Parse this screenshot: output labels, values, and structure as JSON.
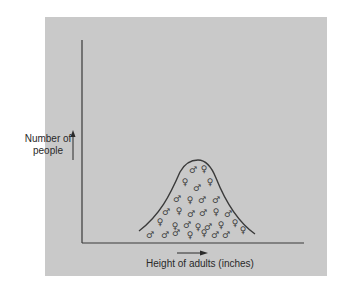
{
  "figure": {
    "y_axis_label_line1": "Number of",
    "y_axis_label_line2": "people",
    "x_axis_label": "Height of adults (inches)",
    "curve_type": "bell-shaped normal distribution",
    "symbols": {
      "male": "♂",
      "female": "♀"
    },
    "individuals": [
      {
        "sex": "male"
      },
      {
        "sex": "female"
      },
      {
        "sex": "female"
      },
      {
        "sex": "male"
      },
      {
        "sex": "female"
      },
      {
        "sex": "male"
      },
      {
        "sex": "female"
      },
      {
        "sex": "male"
      },
      {
        "sex": "male"
      },
      {
        "sex": "male"
      },
      {
        "sex": "female"
      },
      {
        "sex": "male"
      },
      {
        "sex": "male"
      },
      {
        "sex": "female"
      },
      {
        "sex": "male"
      },
      {
        "sex": "female"
      },
      {
        "sex": "female"
      },
      {
        "sex": "male"
      },
      {
        "sex": "female"
      },
      {
        "sex": "male"
      },
      {
        "sex": "female"
      },
      {
        "sex": "female"
      },
      {
        "sex": "male"
      },
      {
        "sex": "male"
      },
      {
        "sex": "male"
      },
      {
        "sex": "female"
      },
      {
        "sex": "female"
      },
      {
        "sex": "male"
      },
      {
        "sex": "male"
      },
      {
        "sex": "female"
      }
    ]
  },
  "colors": {
    "panel": "#c9c9c9",
    "ink": "#3a3a3a"
  }
}
